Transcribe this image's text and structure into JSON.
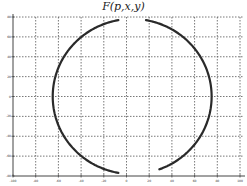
{
  "chart_data": {
    "type": "line",
    "title": "F(p,x,y)",
    "xlabel": "",
    "ylabel": "",
    "grid": true,
    "grid_style": "dotted",
    "legend": null,
    "xlim": [
      -100,
      100
    ],
    "ylim": [
      -80,
      80
    ],
    "x_ticks": [
      -100,
      -80,
      -60,
      -40,
      -20,
      0,
      20,
      40,
      60,
      80,
      100
    ],
    "y_ticks": [
      80,
      60,
      40,
      20,
      0,
      -20,
      -40,
      -60,
      -80
    ],
    "series": [
      {
        "name": "F(p,x,y)",
        "description": "Near-elliptical closed curve centered near (5, 0), horizontal semi-axis ~70, vertical semi-axis ~78, with small gaps at the top center and bottom center",
        "color": "#333333",
        "center": [
          5,
          0
        ],
        "semi_axes": [
          70,
          78
        ],
        "gaps_deg": [
          [
            80,
            100
          ],
          [
            260,
            290
          ]
        ]
      }
    ]
  },
  "ui": {
    "title": "F(p,x,y)",
    "axis_color": "#444444",
    "grid_color": "#555555",
    "curve_color": "#2a2a2a"
  }
}
